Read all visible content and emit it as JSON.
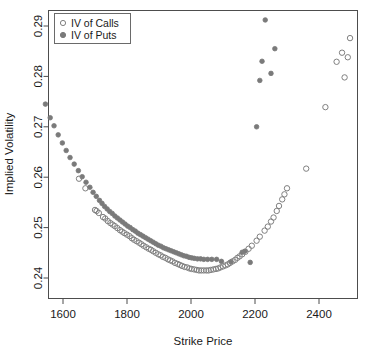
{
  "chart_data": {
    "type": "scatter",
    "title": "",
    "xlabel": "Strike Price",
    "ylabel": "Implied Volatility",
    "xlim": [
      1530,
      1530
    ],
    "ylim": [
      0.2355,
      0.2935
    ],
    "xticks": [
      1600,
      1800,
      2000,
      2200,
      2400
    ],
    "xtick_labels": [
      "1600",
      "1800",
      "2000",
      "2200",
      "2400"
    ],
    "yticks": [
      0.24,
      0.25,
      0.26,
      0.27,
      0.28,
      0.29
    ],
    "ytick_labels": [
      "0.24",
      "0.25",
      "0.26",
      "0.27",
      "0.28",
      "0.29"
    ],
    "grid": false,
    "legend_position": "top-left",
    "series": [
      {
        "name": "IV of Calls",
        "marker": "open-circle",
        "color": "#808080",
        "points": [
          [
            1650,
            0.2597
          ],
          [
            1670,
            0.2578
          ],
          [
            1700,
            0.2535
          ],
          [
            1705,
            0.2533
          ],
          [
            1712,
            0.2529
          ],
          [
            1725,
            0.2521
          ],
          [
            1732,
            0.2518
          ],
          [
            1740,
            0.2513
          ],
          [
            1748,
            0.2509
          ],
          [
            1755,
            0.2506
          ],
          [
            1762,
            0.2503
          ],
          [
            1770,
            0.2499
          ],
          [
            1778,
            0.2495
          ],
          [
            1785,
            0.2492
          ],
          [
            1792,
            0.2489
          ],
          [
            1800,
            0.2486
          ],
          [
            1808,
            0.2483
          ],
          [
            1815,
            0.2479
          ],
          [
            1822,
            0.2476
          ],
          [
            1830,
            0.2473
          ],
          [
            1838,
            0.247
          ],
          [
            1845,
            0.2467
          ],
          [
            1852,
            0.2464
          ],
          [
            1860,
            0.2461
          ],
          [
            1868,
            0.2458
          ],
          [
            1875,
            0.2456
          ],
          [
            1882,
            0.2453
          ],
          [
            1890,
            0.245
          ],
          [
            1898,
            0.2447
          ],
          [
            1905,
            0.2445
          ],
          [
            1912,
            0.2442
          ],
          [
            1920,
            0.244
          ],
          [
            1928,
            0.2437
          ],
          [
            1935,
            0.2435
          ],
          [
            1942,
            0.2433
          ],
          [
            1950,
            0.243
          ],
          [
            1958,
            0.2428
          ],
          [
            1965,
            0.2426
          ],
          [
            1972,
            0.2424
          ],
          [
            1980,
            0.2422
          ],
          [
            1988,
            0.2421
          ],
          [
            1995,
            0.2419
          ],
          [
            2002,
            0.2418
          ],
          [
            2010,
            0.2417
          ],
          [
            2018,
            0.2416
          ],
          [
            2025,
            0.2415
          ],
          [
            2032,
            0.2415
          ],
          [
            2040,
            0.2415
          ],
          [
            2048,
            0.2415
          ],
          [
            2055,
            0.2415
          ],
          [
            2062,
            0.2416
          ],
          [
            2070,
            0.2417
          ],
          [
            2078,
            0.2418
          ],
          [
            2085,
            0.2419
          ],
          [
            2092,
            0.2421
          ],
          [
            2100,
            0.2423
          ],
          [
            2108,
            0.2425
          ],
          [
            2115,
            0.2427
          ],
          [
            2122,
            0.243
          ],
          [
            2130,
            0.2433
          ],
          [
            2138,
            0.2436
          ],
          [
            2145,
            0.244
          ],
          [
            2152,
            0.2443
          ],
          [
            2160,
            0.2447
          ],
          [
            2170,
            0.2452
          ],
          [
            2180,
            0.2458
          ],
          [
            2190,
            0.2464
          ],
          [
            2205,
            0.2474
          ],
          [
            2215,
            0.2482
          ],
          [
            2230,
            0.2494
          ],
          [
            2240,
            0.2502
          ],
          [
            2250,
            0.2512
          ],
          [
            2258,
            0.252
          ],
          [
            2268,
            0.2533
          ],
          [
            2275,
            0.2543
          ],
          [
            2285,
            0.2556
          ],
          [
            2292,
            0.2566
          ],
          [
            2300,
            0.2578
          ],
          [
            2360,
            0.2617
          ],
          [
            2420,
            0.2739
          ],
          [
            2455,
            0.2829
          ],
          [
            2472,
            0.2847
          ],
          [
            2480,
            0.2798
          ],
          [
            2490,
            0.2838
          ],
          [
            2497,
            0.2876
          ]
        ]
      },
      {
        "name": "IV of Puts",
        "marker": "filled-circle",
        "color": "#7a7a7a",
        "points": [
          [
            1545,
            0.2745
          ],
          [
            1560,
            0.2718
          ],
          [
            1572,
            0.2702
          ],
          [
            1585,
            0.2684
          ],
          [
            1598,
            0.2668
          ],
          [
            1610,
            0.2653
          ],
          [
            1622,
            0.2639
          ],
          [
            1635,
            0.2626
          ],
          [
            1648,
            0.2613
          ],
          [
            1660,
            0.2601
          ],
          [
            1672,
            0.259
          ],
          [
            1684,
            0.258
          ],
          [
            1694,
            0.257
          ],
          [
            1704,
            0.2562
          ],
          [
            1714,
            0.2554
          ],
          [
            1722,
            0.2548
          ],
          [
            1730,
            0.2542
          ],
          [
            1738,
            0.2537
          ],
          [
            1746,
            0.2532
          ],
          [
            1754,
            0.2528
          ],
          [
            1762,
            0.2523
          ],
          [
            1770,
            0.2519
          ],
          [
            1778,
            0.2515
          ],
          [
            1786,
            0.2511
          ],
          [
            1794,
            0.2507
          ],
          [
            1802,
            0.2503
          ],
          [
            1810,
            0.25
          ],
          [
            1818,
            0.2496
          ],
          [
            1826,
            0.2493
          ],
          [
            1834,
            0.2489
          ],
          [
            1842,
            0.2486
          ],
          [
            1850,
            0.2483
          ],
          [
            1858,
            0.248
          ],
          [
            1866,
            0.2477
          ],
          [
            1874,
            0.2474
          ],
          [
            1882,
            0.2471
          ],
          [
            1890,
            0.2468
          ],
          [
            1898,
            0.2465
          ],
          [
            1906,
            0.2463
          ],
          [
            1914,
            0.246
          ],
          [
            1922,
            0.2458
          ],
          [
            1930,
            0.2456
          ],
          [
            1938,
            0.2454
          ],
          [
            1946,
            0.2452
          ],
          [
            1954,
            0.245
          ],
          [
            1962,
            0.2448
          ],
          [
            1970,
            0.2446
          ],
          [
            1978,
            0.2444
          ],
          [
            1986,
            0.2443
          ],
          [
            1994,
            0.2441
          ],
          [
            2002,
            0.244
          ],
          [
            2010,
            0.2439
          ],
          [
            2020,
            0.2438
          ],
          [
            2030,
            0.2438
          ],
          [
            2040,
            0.2437
          ],
          [
            2052,
            0.2437
          ],
          [
            2065,
            0.2437
          ],
          [
            2080,
            0.2437
          ],
          [
            2095,
            0.2433
          ],
          [
            2125,
            0.2432
          ],
          [
            2160,
            0.2451
          ],
          [
            2168,
            0.2453
          ],
          [
            2185,
            0.2431
          ],
          [
            2205,
            0.27
          ],
          [
            2215,
            0.2792
          ],
          [
            2222,
            0.283
          ],
          [
            2232,
            0.2912
          ],
          [
            2250,
            0.2806
          ],
          [
            2262,
            0.2855
          ]
        ]
      }
    ]
  },
  "legend": {
    "entries": [
      {
        "label": "IV of Calls",
        "marker": "open-circle"
      },
      {
        "label": "IV of Puts",
        "marker": "filled-circle"
      }
    ]
  },
  "axes": {
    "x_title": "Strike Price",
    "y_title": "Implied Volatility"
  },
  "colors": {
    "marker_calls": "#808080",
    "marker_puts": "#7a7a7a",
    "axis": "#4d4d4d",
    "text": "#1a1a1a",
    "background": "#ffffff"
  }
}
